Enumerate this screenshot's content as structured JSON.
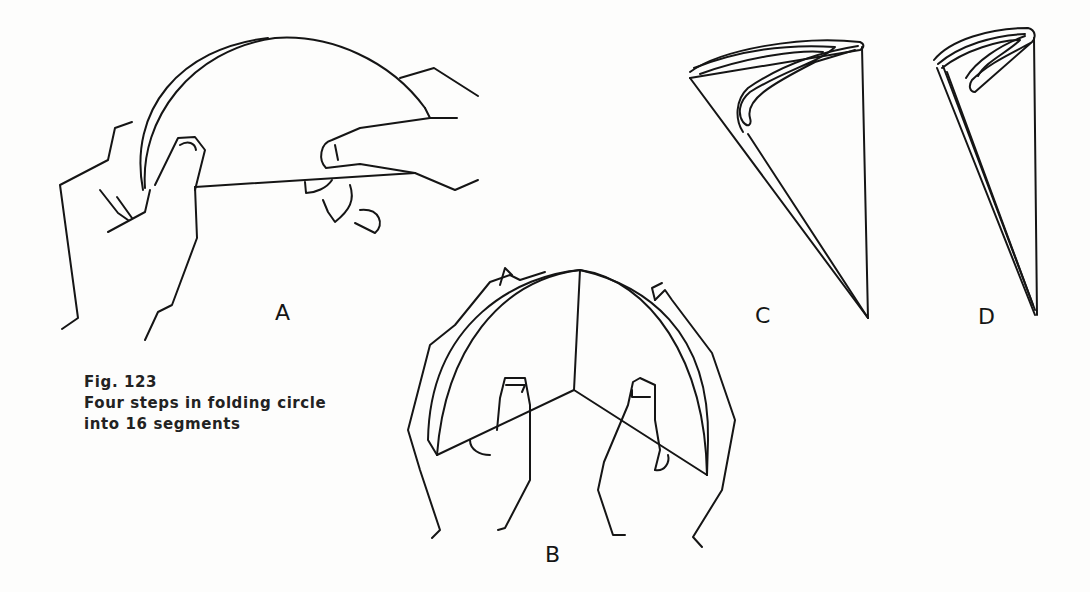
{
  "figure": {
    "caption": {
      "number": "Fig. 123",
      "line1": "Four steps in folding circle",
      "line2": "into 16 segments"
    },
    "panels": [
      {
        "id": "A",
        "label": "A",
        "description": "Hands folding a circle in half"
      },
      {
        "id": "B",
        "label": "B",
        "description": "Hands folding semicircle into quarters"
      },
      {
        "id": "C",
        "label": "C",
        "description": "Folded into eighths"
      },
      {
        "id": "D",
        "label": "D",
        "description": "Folded into sixteenths"
      }
    ],
    "colors": {
      "line": "#151515",
      "background": "#fdfdfc"
    }
  }
}
